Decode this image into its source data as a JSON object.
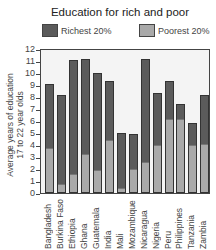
{
  "chart_data": {
    "type": "bar",
    "stacked": false,
    "overlaid": true,
    "title": "Education for rich and poor",
    "xlabel": "",
    "ylabel": "Average years of education 17 to 22 year olds",
    "ylabel_lines": [
      "Average years of education",
      "17 to 22 year olds"
    ],
    "ylim": [
      0,
      12
    ],
    "yticks": [
      0,
      1,
      2,
      3,
      4,
      5,
      6,
      7,
      8,
      9,
      10,
      11,
      12
    ],
    "grid": false,
    "legend_position": "top",
    "categories": [
      "Bangladesh",
      "Burkina Faso",
      "Ethiopia",
      "Ghana",
      "Guatemala",
      "India",
      "Mali",
      "Mozambique",
      "Nicaragua",
      "Nigeria",
      "Peru",
      "Philippines",
      "Tanzania",
      "Zambia"
    ],
    "series": [
      {
        "name": "Richest 20%",
        "color": "#5b5b5b",
        "values": [
          9.1,
          8.2,
          11.1,
          11.2,
          10.0,
          9.3,
          5.0,
          4.9,
          11.2,
          8.3,
          9.3,
          7.4,
          5.8,
          8.2
        ]
      },
      {
        "name": "Poorest 20%",
        "color": "#a9a9a9",
        "values": [
          3.7,
          0.7,
          1.5,
          3.2,
          1.8,
          4.3,
          0.3,
          1.9,
          2.5,
          3.9,
          6.1,
          6.1,
          3.9,
          4.0
        ]
      }
    ]
  },
  "legend": {
    "richest_label": "Richest 20%",
    "poorest_label": "Poorest 20%"
  }
}
